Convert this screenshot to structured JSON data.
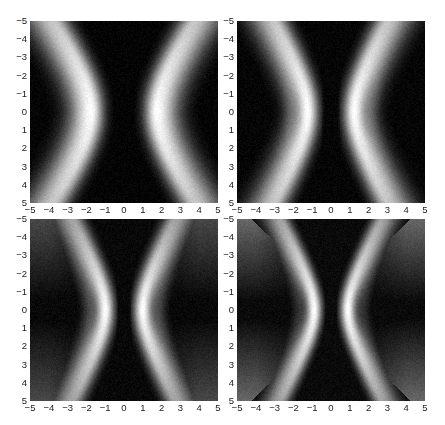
{
  "chart_data": [
    {
      "type": "heatmap",
      "title": "",
      "xlabel": "",
      "ylabel": "",
      "xlim": [
        -5,
        5
      ],
      "ylim": [
        -5,
        5
      ],
      "y_axis_reversed": true,
      "colormap": "gray",
      "xticks": [
        "-5",
        "-4",
        "-3",
        "-2",
        "-1",
        "0",
        "1",
        "2",
        "3",
        "4",
        "5"
      ],
      "yticks": [
        "-5",
        "-4",
        "-3",
        "-2",
        "-1",
        "0",
        "1",
        "2",
        "3",
        "4",
        "5"
      ],
      "description": "Two symmetric bright hyperbolic lobes about x=0; dark centre band |x|<~0.7; lobe peak near x=±1.8 at y=0, widening outward toward y=±5",
      "params": {
        "waist": 1.75,
        "flare": 0.09,
        "width": 0.95,
        "gap": 0.62,
        "gapFlare": 0.015,
        "floor": 0.04,
        "ripple": 0.0,
        "edgeGlow": 0.0
      }
    },
    {
      "type": "heatmap",
      "title": "",
      "xlabel": "",
      "ylabel": "",
      "xlim": [
        -5,
        5
      ],
      "ylim": [
        -5,
        5
      ],
      "y_axis_reversed": true,
      "colormap": "gray",
      "xticks": [
        "-5",
        "-4",
        "-3",
        "-2",
        "-1",
        "0",
        "1",
        "2",
        "3",
        "4",
        "5"
      ],
      "yticks": [
        "-5",
        "-4",
        "-3",
        "-2",
        "-1",
        "0",
        "1",
        "2",
        "3",
        "4",
        "5"
      ],
      "description": "Bright lobes closer to centre (peak near x=±1.2 at y=0) with faint dark notch near x=±2.3, y=0; lobes flare outward toward top/bottom",
      "params": {
        "waist": 1.25,
        "flare": 0.12,
        "width": 0.85,
        "gap": 0.5,
        "gapFlare": 0.02,
        "floor": 0.05,
        "ripple": 0.25,
        "edgeGlow": 0.0
      }
    },
    {
      "type": "heatmap",
      "title": "",
      "xlabel": "",
      "ylabel": "",
      "xlim": [
        -5,
        5
      ],
      "ylim": [
        -5,
        5
      ],
      "y_axis_reversed": true,
      "colormap": "gray",
      "xticks": [
        "-5",
        "-4",
        "-3",
        "-2",
        "-1",
        "0",
        "1",
        "2",
        "3",
        "4",
        "5"
      ],
      "yticks": [
        "-5",
        "-4",
        "-3",
        "-2",
        "-1",
        "0",
        "1",
        "2",
        "3",
        "4",
        "5"
      ],
      "description": "Sharp bright lobes at x=±1.0 near y=0 with secondary faint fringes at x≈±1.8 and ±2.5; broad grey wings fanning out toward corners",
      "params": {
        "waist": 1.0,
        "flare": 0.16,
        "width": 0.7,
        "gap": 0.4,
        "gapFlare": 0.035,
        "floor": 0.08,
        "ripple": 0.45,
        "edgeGlow": 0.35
      }
    },
    {
      "type": "heatmap",
      "title": "",
      "xlabel": "",
      "ylabel": "",
      "xlim": [
        -5,
        5
      ],
      "ylim": [
        -5,
        5
      ],
      "y_axis_reversed": true,
      "colormap": "gray",
      "xticks": [
        "-5",
        "-4",
        "-3",
        "-2",
        "-1",
        "0",
        "1",
        "2",
        "3",
        "4",
        "5"
      ],
      "yticks": [
        "-5",
        "-4",
        "-3",
        "-2",
        "-1",
        "0",
        "1",
        "2",
        "3",
        "4",
        "5"
      ],
      "description": "Narrow intense lobes at x=±0.9 near y=0 with multiple fringe ripples; bow-tie shaped dark centre widening to |x|<~2.5 at y=±5; grey corners",
      "params": {
        "waist": 0.9,
        "flare": 0.2,
        "width": 0.6,
        "gap": 0.35,
        "gapFlare": 0.06,
        "floor": 0.1,
        "ripple": 0.6,
        "edgeGlow": 0.5
      }
    }
  ],
  "layout": {
    "panels": [
      {
        "left": 30,
        "top": 21,
        "width": 188,
        "height": 182
      },
      {
        "left": 237,
        "top": 21,
        "width": 188,
        "height": 182
      },
      {
        "left": 30,
        "top": 219,
        "width": 188,
        "height": 182
      },
      {
        "left": 237,
        "top": 219,
        "width": 188,
        "height": 182
      }
    ]
  }
}
